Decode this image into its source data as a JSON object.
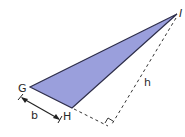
{
  "diagram": {
    "type": "triangle-area",
    "fill_color": "#9a9fdc",
    "stroke_color": "#2e2e4a",
    "vertices": [
      {
        "label": "G",
        "x": 30,
        "y": 87
      },
      {
        "label": "H",
        "x": 72,
        "y": 108
      },
      {
        "label": "I",
        "x": 177,
        "y": 14
      }
    ],
    "labels": {
      "G": "G",
      "H": "H",
      "I": "I",
      "base": "b",
      "height": "h"
    },
    "base_measure": {
      "from": "G",
      "to": "H",
      "label": "b"
    },
    "height_measure": {
      "from": "I",
      "to": "foot",
      "label": "h",
      "style": "dashed"
    },
    "extension": {
      "from": "H",
      "to": "foot",
      "style": "dashed"
    },
    "foot": {
      "x": 110,
      "y": 127
    },
    "right_angle_marker": true
  }
}
